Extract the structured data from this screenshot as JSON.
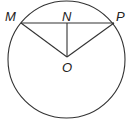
{
  "diagram": {
    "type": "circle-geometry",
    "stroke_color": "#333333",
    "circle": {
      "cx": 66.5,
      "cy": 59.5,
      "r": 58.5
    },
    "points": {
      "M": {
        "label": "M",
        "x": 21,
        "y": 23,
        "label_x": 5,
        "label_y": 21
      },
      "N": {
        "label": "N",
        "x": 67,
        "y": 23,
        "label_x": 62,
        "label_y": 21
      },
      "P": {
        "label": "P",
        "x": 114,
        "y": 23,
        "label_x": 117,
        "label_y": 21
      },
      "O": {
        "label": "O",
        "x": 67,
        "y": 57,
        "label_x": 62,
        "label_y": 72
      }
    },
    "segments": [
      {
        "name": "chord-MP",
        "from": "M",
        "to": "P"
      },
      {
        "name": "segment-NO",
        "from": "N",
        "to": "O"
      },
      {
        "name": "radius-MO",
        "from": "M",
        "to": "O"
      },
      {
        "name": "radius-PO",
        "from": "P",
        "to": "O"
      }
    ]
  }
}
